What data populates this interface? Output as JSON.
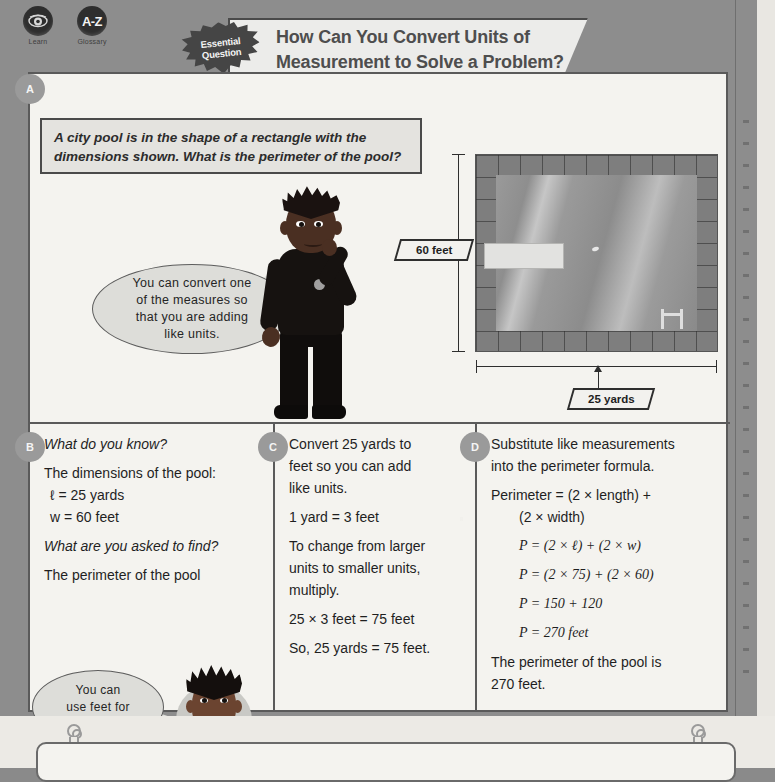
{
  "toolbar": {
    "items": [
      {
        "label": "Learn",
        "icon": "eye-icon"
      },
      {
        "label": "Glossary",
        "icon": "a-z-icon"
      }
    ]
  },
  "header": {
    "starburst_line1": "Essential",
    "starburst_line2": "Question",
    "title_line1": "How Can You Convert Units of",
    "title_line2": "Measurement to Solve a Problem?"
  },
  "badges": {
    "a": "A",
    "b": "B",
    "c": "C",
    "d": "D"
  },
  "problem": {
    "line1": "A city pool is in the shape of a rectangle with the",
    "line2": "dimensions shown. What is the perimeter of the pool?"
  },
  "boy_bubble": {
    "line1": "You can convert one",
    "line2": "of the measures so",
    "line3": "that you are adding",
    "line4": "like units."
  },
  "diagram": {
    "label_height": "60 feet",
    "label_width": "25 yards"
  },
  "panel_b": {
    "q1": "What do you know?",
    "body1": "The dimensions of the pool:",
    "length": "ℓ = 25 yards",
    "width": "w = 60 feet",
    "q2": "What are you asked to find?",
    "body2": "The perimeter of the pool"
  },
  "girl_bubble": {
    "line1": "You can",
    "line2": "use feet for",
    "line3": "perimeter."
  },
  "panel_c": {
    "line1": "Convert 25 yards to",
    "line2": "feet so you can add",
    "line3": "like units.",
    "fact": "1 yard = 3 feet",
    "rule1": "To change from larger",
    "rule2": "units to smaller units,",
    "rule3": "multiply.",
    "calc": "25 × 3 feet = 75 feet",
    "conclusion": "So, 25 yards = 75 feet."
  },
  "panel_d": {
    "line1": "Substitute like measurements",
    "line2": "into the perimeter formula.",
    "formula1": "Perimeter = (2 × length) +",
    "formula2": "(2 × width)",
    "step1": "P = (2 × ℓ) + (2 × w)",
    "step2": "P = (2 × 75) + (2 × 60)",
    "step3": "P = 150 + 120",
    "step4": "P = 270 feet",
    "answer1": "The perimeter of the pool is",
    "answer2": "270 feet."
  },
  "colors": {
    "page_gray": "#8d8d8d",
    "card_bg": "#f4f3ef",
    "border": "#5a5a5a",
    "badge": "#9a9a9a",
    "bubble": "#ddddd9"
  }
}
